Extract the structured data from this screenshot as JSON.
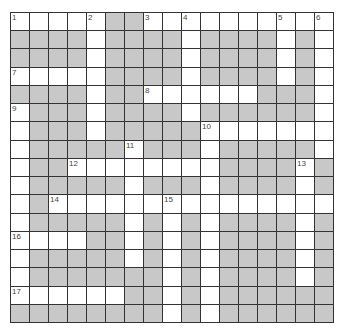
{
  "puzzle": {
    "rows": 17,
    "cols": 17,
    "colors": {
      "block": "#c8c8c8",
      "open": "#ffffff",
      "line": "#333333"
    },
    "layout": [
      "WWWWWGGWWWWWWWWWW",
      "GGGGWGGGGWGGGGWGW",
      "GGGGWGGGGWGGGGWGW",
      "WWWWWGGGGWGGGGWGW",
      "GGGGWGGWWWWWWGGGW",
      "WGGGWGGGGWGGGGGGW",
      "WGGGWGGGGGWWWWWWW",
      "WGGGGGWGGGWGGGGGW",
      "WGGWWWWWWWWGGGGWG",
      "WGGGGGWGGGWGGGGWG",
      "WGWWWWWWWWWWWWWWW",
      "WGGGGGWGWGWGGGGWG",
      "WWWWGGWGWGWGGGGWG",
      "WGGGGGWGWGWGGGGWG",
      "WGGGGGGGWGWGGGGWG",
      "WWWWWWGGWGWGGGGGG",
      "GGGGGGGGWGWGGGGGG"
    ],
    "numbers": [
      {
        "n": "1",
        "r": 0,
        "c": 0
      },
      {
        "n": "2",
        "r": 0,
        "c": 4
      },
      {
        "n": "3",
        "r": 0,
        "c": 7
      },
      {
        "n": "4",
        "r": 0,
        "c": 9
      },
      {
        "n": "5",
        "r": 0,
        "c": 14
      },
      {
        "n": "6",
        "r": 0,
        "c": 16
      },
      {
        "n": "7",
        "r": 3,
        "c": 0
      },
      {
        "n": "8",
        "r": 4,
        "c": 7
      },
      {
        "n": "9",
        "r": 5,
        "c": 0
      },
      {
        "n": "10",
        "r": 6,
        "c": 10
      },
      {
        "n": "11",
        "r": 7,
        "c": 6
      },
      {
        "n": "12",
        "r": 8,
        "c": 3
      },
      {
        "n": "13",
        "r": 8,
        "c": 15
      },
      {
        "n": "14",
        "r": 10,
        "c": 2
      },
      {
        "n": "15",
        "r": 10,
        "c": 8
      },
      {
        "n": "16",
        "r": 12,
        "c": 0
      },
      {
        "n": "17",
        "r": 15,
        "c": 0
      }
    ]
  }
}
